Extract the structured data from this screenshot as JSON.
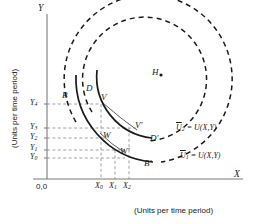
{
  "figure": {
    "background": "#ffffff",
    "ink": "#1a1a1a"
  },
  "axes": {
    "x_label": "X",
    "y_label": "Y",
    "x_title": "(Units per time period)",
    "y_title": "(Units per time period)",
    "origin_label": "0,0",
    "x_ticks": [
      {
        "name": "X0",
        "base": "X",
        "sub": "0",
        "x": 98
      },
      {
        "name": "X1",
        "base": "X",
        "sub": "1",
        "x": 114
      },
      {
        "name": "X2",
        "base": "X",
        "sub": "2",
        "x": 128
      }
    ],
    "y_ticks": [
      {
        "name": "Y4",
        "base": "Y",
        "sub": "4",
        "y": 104
      },
      {
        "name": "Y3",
        "base": "Y",
        "sub": "3",
        "y": 128
      },
      {
        "name": "Y2",
        "base": "Y",
        "sub": "2",
        "y": 138
      },
      {
        "name": "Y1",
        "base": "Y",
        "sub": "1",
        "y": 150
      },
      {
        "name": "Y0",
        "base": "Y",
        "sub": "0",
        "y": 158
      }
    ]
  },
  "points": [
    {
      "name": "B",
      "label": "B",
      "x": 66,
      "y": 96
    },
    {
      "name": "D",
      "label": "D",
      "x": 89,
      "y": 90
    },
    {
      "name": "V",
      "label": "V",
      "x": 103,
      "y": 98
    },
    {
      "name": "H",
      "label": "H",
      "x": 153,
      "y": 73
    },
    {
      "name": "V-prime",
      "label": "V'",
      "x": 137,
      "y": 126
    },
    {
      "name": "W",
      "label": "W",
      "x": 106,
      "y": 137
    },
    {
      "name": "D-prime",
      "label": "D'",
      "x": 151,
      "y": 139
    },
    {
      "name": "W-prime",
      "label": "W'",
      "x": 123,
      "y": 152
    },
    {
      "name": "B-prime",
      "label": "B'",
      "x": 146,
      "y": 163
    }
  ],
  "curves": [
    {
      "name": "indifference-curve-u1",
      "equation_label": "Ų1 = U(X,Y)",
      "eq_base": "U",
      "eq_sub": "1",
      "eq_rest": " = U(X,Y)",
      "label_x": 180,
      "label_y": 153,
      "style": "dashed",
      "center_x": 145,
      "center_y": 78,
      "radius": 84
    },
    {
      "name": "indifference-curve-u2",
      "equation_label": "Ų2 = U(X,Y)",
      "eq_base": "U",
      "eq_sub": "2",
      "eq_rest": " = U(X,Y)",
      "label_x": 176,
      "label_y": 129,
      "style": "dashed",
      "center_x": 146,
      "center_y": 79,
      "radius": 62
    }
  ],
  "bliss_point": {
    "name": "H",
    "label": "H",
    "x": 153,
    "y": 73
  }
}
